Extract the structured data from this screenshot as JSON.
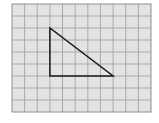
{
  "diagram": {
    "type": "grid-with-triangle",
    "grid": {
      "origin_px": [
        12,
        4
      ],
      "columns": 11,
      "rows": 9,
      "cell_width_px": 12.636,
      "cell_height_px": 12,
      "background_color": "#e3e3e3",
      "line_color": "#a9a9a9",
      "border_color": "#8f8f8f"
    },
    "triangle": {
      "shape": "right triangle",
      "vertices_grid": [
        [
          3,
          2
        ],
        [
          3,
          6
        ],
        [
          8,
          6
        ]
      ],
      "stroke_color": "#1a1a1a",
      "stroke_width": 1.5,
      "legs": {
        "vertical_units": 4,
        "horizontal_units": 5
      }
    }
  }
}
